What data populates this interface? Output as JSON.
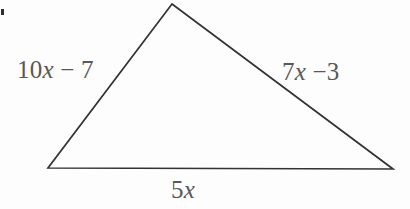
{
  "figure": {
    "kind": "triangle-diagram",
    "canvas": {
      "width": 410,
      "height": 209
    },
    "background_color": "#fdfdfd",
    "stroke_color": "#333333",
    "stroke_width": 1.7,
    "text_color": "#585858",
    "vertices": {
      "apex": {
        "x": 172,
        "y": 4
      },
      "bottom_left": {
        "x": 48,
        "y": 168
      },
      "bottom_right": {
        "x": 393,
        "y": 169
      }
    },
    "polygon_points": "172,4 48,168 393,169"
  },
  "labels": {
    "left_side": {
      "full_text": "10x − 7",
      "coefficient": "10",
      "variable": "x",
      "operator": " − ",
      "constant": "7"
    },
    "right_side": {
      "full_text": "7x −3",
      "coefficient": "7",
      "variable": "x",
      "operator": " −",
      "constant": "3"
    },
    "base": {
      "full_text": "5x",
      "coefficient": "5",
      "variable": "x"
    }
  },
  "artifact": {
    "name": "scan-speck",
    "color": "#2e2e2e"
  }
}
